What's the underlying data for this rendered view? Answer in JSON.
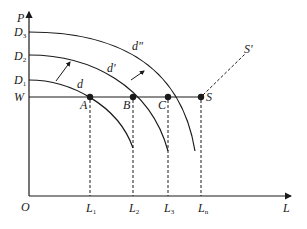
{
  "diagram": {
    "axes": {
      "y_label": "P",
      "x_label": "L",
      "origin_label": "O"
    },
    "y_ticks": [
      {
        "main": "D",
        "sub": "3"
      },
      {
        "main": "D",
        "sub": "2"
      },
      {
        "main": "D",
        "sub": "1"
      },
      {
        "main": "W",
        "sub": ""
      }
    ],
    "x_ticks": [
      {
        "main": "L",
        "sub": "1"
      },
      {
        "main": "L",
        "sub": "2"
      },
      {
        "main": "L",
        "sub": "3"
      },
      {
        "main": "L",
        "sub": "n"
      }
    ],
    "curves": [
      {
        "label": "d"
      },
      {
        "label": "d'"
      },
      {
        "label": "d\""
      }
    ],
    "points": [
      "A",
      "B",
      "C",
      "S"
    ],
    "supply_label": "S'",
    "colors": {
      "line": "#1a1a1a",
      "background": "#ffffff"
    }
  }
}
